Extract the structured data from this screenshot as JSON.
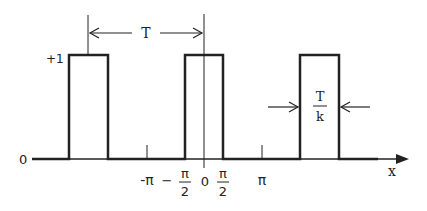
{
  "diagram": {
    "y_labels": {
      "high": "+1",
      "zero": "0"
    },
    "x_axis_label": "x",
    "period_label": "T",
    "width_label": {
      "numerator": "T",
      "denominator": "k"
    },
    "tick_labels": {
      "neg_pi": "-π",
      "neg_half_pi_sign": "−",
      "half_pi_num": "π",
      "half_pi_den": "2",
      "zero": "0",
      "pos_half_pi_num": "π",
      "pos_half_pi_den": "2",
      "pi": "π"
    },
    "colors": {
      "stroke": "#222222",
      "background": "#ffffff"
    }
  }
}
